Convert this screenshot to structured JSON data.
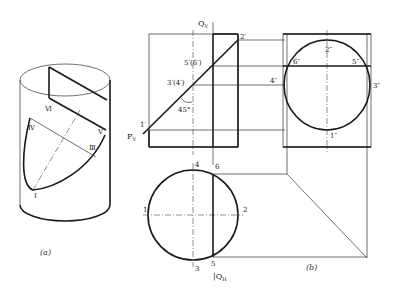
{
  "figure_a": {
    "caption": "(a)",
    "labels": {
      "VI": "Ⅵ",
      "IV": "Ⅳ",
      "V": "Ⅴ",
      "III": "Ⅲ",
      "I": "Ⅰ"
    }
  },
  "figure_b": {
    "caption": "(b)",
    "front_view": {
      "plane_label": "Q",
      "plane_sub": "V",
      "trace_label": "P",
      "trace_sub": "V",
      "points": {
        "p2": "2′",
        "p56": "5′(6′)",
        "p34": "3′(4′)",
        "p1": "1′"
      },
      "angle": "45°"
    },
    "side_view": {
      "points": {
        "p2": "2″",
        "p6": "6″",
        "p5": "5″",
        "p4": "4″",
        "p3": "3″",
        "p1": "1″"
      }
    },
    "top_view": {
      "plane_label": "Q",
      "plane_sub": "H",
      "points": {
        "p4": "4",
        "p6": "6",
        "p1": "1",
        "p2": "2",
        "p3": "3",
        "p5": "5"
      }
    }
  },
  "colors": {
    "line": "#1a1a1a",
    "background": "#ffffff"
  }
}
